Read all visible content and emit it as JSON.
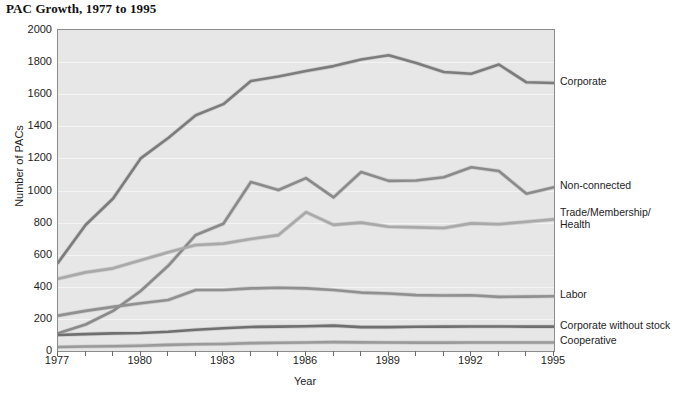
{
  "chart_data": {
    "type": "line",
    "title": "PAC Growth, 1977 to 1995",
    "xlabel": "Year",
    "ylabel": "Number of PACs",
    "ylim": [
      0,
      2000
    ],
    "xlim": [
      1977,
      1995
    ],
    "ytick_step": 200,
    "yticks": [
      "0",
      "200",
      "400",
      "600",
      "800",
      "1000",
      "1200",
      "1400",
      "1600",
      "1800",
      "2000"
    ],
    "xticks": [
      "1977",
      "1980",
      "1983",
      "1986",
      "1989",
      "1992",
      "1995"
    ],
    "grid": true,
    "legend_position": "right-of-plot-inline",
    "x": [
      1977,
      1978,
      1979,
      1980,
      1981,
      1982,
      1983,
      1984,
      1985,
      1986,
      1987,
      1988,
      1989,
      1990,
      1991,
      1992,
      1993,
      1994,
      1995
    ],
    "series": [
      {
        "name": "Corporate",
        "color": "#7c7c7c",
        "values": [
          550,
          785,
          950,
          1200,
          1327,
          1469,
          1538,
          1682,
          1710,
          1744,
          1775,
          1816,
          1843,
          1795,
          1738,
          1727,
          1785,
          1674,
          1670
        ]
      },
      {
        "name": "Non-connected",
        "color": "#8a8a8a",
        "values": [
          110,
          165,
          250,
          374,
          531,
          723,
          793,
          1053,
          1003,
          1077,
          957,
          1115,
          1060,
          1062,
          1083,
          1145,
          1121,
          980,
          1020
        ]
      },
      {
        "name": "Trade/Membership/\nHealth",
        "color": "#a9a9a9",
        "values": [
          450,
          490,
          515,
          565,
          615,
          660,
          669,
          698,
          722,
          865,
          786,
          800,
          774,
          770,
          766,
          795,
          790,
          805,
          820
        ]
      },
      {
        "name": "Labor",
        "color": "#909090",
        "values": [
          220,
          250,
          275,
          297,
          318,
          380,
          380,
          390,
          394,
          390,
          380,
          364,
          358,
          348,
          346,
          347,
          337,
          339,
          341
        ]
      },
      {
        "name": "Corporate without stock",
        "color": "#6f6f6f",
        "values": [
          100,
          105,
          110,
          112,
          120,
          132,
          142,
          150,
          152,
          154,
          158,
          149,
          149,
          151,
          152,
          153,
          153,
          152,
          152
        ]
      },
      {
        "name": "Cooperative",
        "color": "#9a9a9a",
        "values": [
          25,
          28,
          30,
          33,
          38,
          42,
          44,
          49,
          51,
          53,
          55,
          54,
          53,
          52,
          52,
          53,
          53,
          53,
          53
        ]
      }
    ],
    "series_label_positions": [
      {
        "name": "Corporate",
        "label": "Corporate",
        "y_value": 1670
      },
      {
        "name": "Non-connected",
        "label": "Non-connected",
        "y_value": 1020
      },
      {
        "name": "Trade/Membership/Health",
        "label": "Trade/Membership/\nHealth",
        "y_value": 820
      },
      {
        "name": "Labor",
        "label": "Labor",
        "y_value": 341
      },
      {
        "name": "Corporate without stock",
        "label": "Corporate without stock",
        "y_value": 152
      },
      {
        "name": "Cooperative",
        "label": "Cooperative",
        "y_value": 53
      }
    ]
  }
}
